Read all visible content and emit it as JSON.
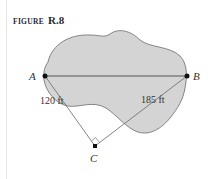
{
  "figure": {
    "label_prefix": "FIGURE",
    "label_number": "R.8"
  },
  "diagram": {
    "points": {
      "A": "A",
      "B": "B",
      "C": "C"
    },
    "segments": {
      "AC_length": "120 ft",
      "BC_length": "185 ft"
    },
    "right_angle_at": "C",
    "colors": {
      "region_fill": "#d4d4d4",
      "outline": "#6a6a6a",
      "lines": "#555555",
      "points": "#111111"
    }
  }
}
